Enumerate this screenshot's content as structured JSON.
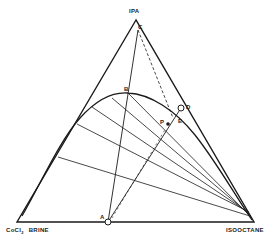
{
  "diagram": {
    "type": "ternary phase diagram",
    "vertices": {
      "top": "IPA",
      "bottom_left_main": "CoCl",
      "bottom_left_sub": "2",
      "bottom_left_suffix": "BRINE",
      "bottom_right": "ISOOCTANE"
    },
    "points": {
      "A": "A",
      "B": "B",
      "C": "C",
      "D": "D",
      "E": "E",
      "P": "P"
    },
    "colors": {
      "line": "#1a1a1a",
      "background": "#ffffff"
    }
  }
}
